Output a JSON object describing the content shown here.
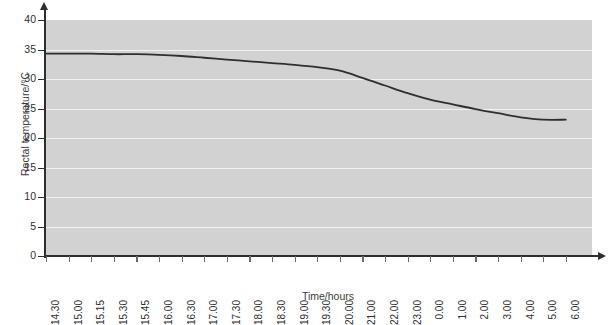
{
  "chart_data": {
    "type": "line",
    "title": "",
    "xlabel": "Time/hours",
    "ylabel": "Rectal temperature/°C",
    "ylim": [
      0,
      40
    ],
    "ytick_values": [
      0,
      5,
      10,
      15,
      20,
      25,
      30,
      35,
      40
    ],
    "ytick_labels": [
      "0",
      "5",
      "10",
      "15",
      "20",
      "25",
      "30",
      "35",
      "40"
    ],
    "grid": "horizontal",
    "legend": "none",
    "categories": [
      "14.30",
      "15.00",
      "15.15",
      "15.30",
      "15.45",
      "16.00",
      "16.30",
      "17.00",
      "17.30",
      "18.00",
      "18.30",
      "19.00",
      "19.30",
      "20.00",
      "21.00",
      "22.00",
      "23.00",
      "0.00",
      "1.00",
      "2.00",
      "3.00",
      "4.00",
      "5.00",
      "6.00"
    ],
    "values": [
      34.3,
      34.3,
      34.3,
      34.2,
      34.2,
      34.1,
      33.9,
      33.6,
      33.3,
      33.0,
      32.7,
      32.4,
      32.0,
      31.4,
      30.2,
      28.9,
      27.6,
      26.5,
      25.7,
      24.9,
      24.2,
      23.5,
      23.1,
      23.1
    ],
    "series": [
      {
        "name": "Rectal temperature",
        "values": [
          34.3,
          34.3,
          34.3,
          34.2,
          34.2,
          34.1,
          33.9,
          33.6,
          33.3,
          33.0,
          32.7,
          32.4,
          32.0,
          31.4,
          30.2,
          28.9,
          27.6,
          26.5,
          25.7,
          24.9,
          24.2,
          23.5,
          23.1,
          23.1
        ],
        "color": "#2e2e2e"
      }
    ],
    "colors": {
      "panel_background": "#d2d2d2",
      "gridline": "#f2f2f2",
      "axis": "#2e2e2e",
      "line": "#2e2e2e",
      "page_background": "#ffffff"
    }
  }
}
